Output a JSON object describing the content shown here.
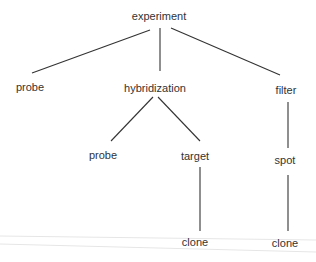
{
  "diagram": {
    "type": "tree",
    "colors": {
      "text": "#333333",
      "edge": "#333333",
      "artifact": "#e4e4e4"
    },
    "nodes": [
      {
        "id": "experiment",
        "label": "experiment",
        "x": 159,
        "y": 16
      },
      {
        "id": "probe1",
        "label": "probe",
        "x": 30,
        "y": 87
      },
      {
        "id": "hybridization",
        "label": "hybridization",
        "x": 155,
        "y": 88
      },
      {
        "id": "filter",
        "label": "filter",
        "x": 286,
        "y": 90
      },
      {
        "id": "probe2",
        "label": "probe",
        "x": 103,
        "y": 155
      },
      {
        "id": "target",
        "label": "target",
        "x": 195,
        "y": 156
      },
      {
        "id": "spot",
        "label": "spot",
        "x": 285,
        "y": 160
      },
      {
        "id": "clone1",
        "label": "clone",
        "x": 195,
        "y": 242
      },
      {
        "id": "clone2",
        "label": "clone",
        "x": 285,
        "y": 243
      }
    ],
    "edges": [
      {
        "from": "experiment",
        "to": "probe1"
      },
      {
        "from": "experiment",
        "to": "hybridization"
      },
      {
        "from": "experiment",
        "to": "filter"
      },
      {
        "from": "hybridization",
        "to": "probe2"
      },
      {
        "from": "hybridization",
        "to": "target"
      },
      {
        "from": "filter",
        "to": "spot"
      },
      {
        "from": "target",
        "to": "clone1"
      },
      {
        "from": "spot",
        "to": "clone2"
      }
    ]
  }
}
